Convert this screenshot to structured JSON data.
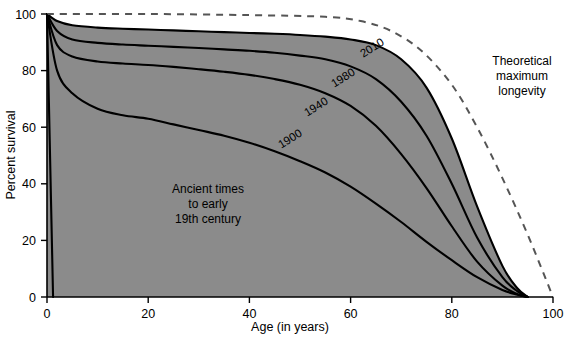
{
  "chart_data": {
    "type": "area",
    "title": "",
    "xlabel": "Age (in years)",
    "ylabel": "Percent survival",
    "xlim": [
      0,
      100
    ],
    "ylim": [
      0,
      100
    ],
    "xticks": [
      0,
      20,
      40,
      60,
      80,
      100
    ],
    "yticks": [
      0,
      20,
      40,
      60,
      80,
      100
    ],
    "xtick_labels": [
      "0",
      "20",
      "40",
      "60",
      "80",
      "100"
    ],
    "ytick_labels": [
      "0",
      "20",
      "40",
      "60",
      "80",
      "100"
    ],
    "grid": false,
    "legend_position": "inline-curve-labels",
    "x": [
      0,
      2,
      5,
      10,
      15,
      20,
      25,
      30,
      35,
      40,
      45,
      50,
      55,
      60,
      65,
      70,
      75,
      80,
      85,
      90,
      93,
      95
    ],
    "series": [
      {
        "name": "2010",
        "label": "2010",
        "fill": "#8b8b8b",
        "values": [
          100,
          97.5,
          96.0,
          95.2,
          94.8,
          94.5,
          94.2,
          93.9,
          93.6,
          93.3,
          93.0,
          92.6,
          92.0,
          91.0,
          89.0,
          84.0,
          74.0,
          56.0,
          32.0,
          11.0,
          3.0,
          0
        ]
      },
      {
        "name": "1980",
        "label": "1980",
        "fill": "#bebebe",
        "values": [
          100,
          94.0,
          91.0,
          89.8,
          89.2,
          88.8,
          88.4,
          88.0,
          87.5,
          87.0,
          86.3,
          85.3,
          84.0,
          81.5,
          77.0,
          69.0,
          57.0,
          40.0,
          21.0,
          7.0,
          2.0,
          0
        ]
      },
      {
        "name": "1940",
        "label": "1940",
        "fill": "#989898",
        "values": [
          100,
          89.0,
          85.0,
          83.2,
          82.5,
          82.0,
          81.3,
          80.5,
          79.6,
          78.5,
          77.0,
          75.0,
          72.0,
          67.5,
          60.5,
          50.5,
          38.5,
          25.0,
          12.5,
          4.0,
          1.0,
          0
        ]
      },
      {
        "name": "1900",
        "label": "1900",
        "fill": "#a6a6a6",
        "values": [
          100,
          80.0,
          72.0,
          66.5,
          64.2,
          63.0,
          61.0,
          59.0,
          57.0,
          54.5,
          51.5,
          48.0,
          44.0,
          39.0,
          33.0,
          26.5,
          19.5,
          13.0,
          7.0,
          2.5,
          0.8,
          0
        ]
      },
      {
        "name": "Ancient times to early 19th century",
        "label": "Ancient times to early 19th century",
        "fill": "#adadad",
        "values": [
          100,
          0,
          0,
          0,
          0,
          0,
          0,
          0,
          0,
          0,
          0,
          0,
          0,
          0,
          0,
          0,
          0,
          0,
          0,
          0,
          0,
          0
        ]
      }
    ],
    "theoretical_curve": {
      "name": "Theoretical maximum longevity",
      "style": "dashed",
      "color": "#555555",
      "x": [
        0,
        20,
        40,
        55,
        62,
        68,
        74,
        80,
        85,
        90,
        95,
        100
      ],
      "values": [
        100,
        100,
        99.6,
        99.0,
        97.5,
        94.0,
        87.0,
        75.0,
        60.0,
        42.0,
        22.0,
        0
      ]
    },
    "annotations": [
      {
        "name": "theoretical-maximum-longevity",
        "lines": [
          "Theoretical",
          "maximum",
          "longevity"
        ]
      },
      {
        "name": "ancient-times",
        "lines": [
          "Ancient times",
          "to early",
          "19th century"
        ]
      }
    ]
  },
  "curve_labels": {
    "c2010": "2010",
    "c1980": "1980",
    "c1940": "1940",
    "c1900": "1900"
  },
  "annotation_theoretical": {
    "line1": "Theoretical",
    "line2": "maximum",
    "line3": "longevity"
  },
  "annotation_ancient": {
    "line1": "Ancient times",
    "line2": "to early",
    "line3": "19th century"
  },
  "axes": {
    "x_title": "Age (in years)",
    "y_title": "Percent survival",
    "x_ticks": [
      "0",
      "20",
      "40",
      "60",
      "80",
      "100"
    ],
    "y_ticks": [
      "0",
      "20",
      "40",
      "60",
      "80",
      "100"
    ]
  },
  "colors": {
    "background": "#ffffff",
    "band_2010": "#8b8b8b",
    "band_1980": "#bebebe",
    "band_1940": "#989898",
    "band_1900": "#a6a6a6",
    "band_ancient": "#adadad",
    "curve_stroke": "#000000",
    "theoretical_stroke": "#555555"
  }
}
